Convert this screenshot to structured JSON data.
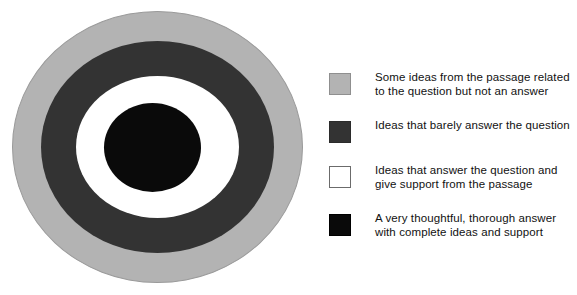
{
  "chart_data": {
    "type": "pie",
    "title": "",
    "subtitle": "",
    "xlabel": "",
    "ylabel": "",
    "grid": false,
    "legend_position": "right",
    "categories": [
      "Some ideas from the passage related to the question but not an answer",
      "Ideas that barely answer the question",
      "Ideas that answer the question and give support from the passage",
      "A very thoughtful, thorough answer with complete ideas and support"
    ],
    "values": [
      290,
      220,
      150,
      94
    ],
    "value_units": "diameter in pixels",
    "colors": [
      "#b3b3b3",
      "#333333",
      "#ffffff",
      "#0a0a0a"
    ],
    "rings": [
      {
        "index": 1,
        "position": "outermost",
        "color": "#b3b3b3",
        "color_name": "light gray",
        "diameter": 290
      },
      {
        "index": 2,
        "position": "second",
        "color": "#333333",
        "color_name": "dark gray",
        "diameter": 220
      },
      {
        "index": 3,
        "position": "third",
        "color": "#ffffff",
        "color_name": "white",
        "diameter": 150
      },
      {
        "index": 4,
        "position": "center",
        "color": "#0a0a0a",
        "color_name": "black",
        "diameter": 94
      }
    ]
  },
  "diagram": {
    "name": "concentric-rubric-target",
    "rings": [
      {
        "key": "outer",
        "color": "#b3b3b3"
      },
      {
        "key": "second",
        "color": "#333333"
      },
      {
        "key": "third",
        "color": "#ffffff"
      },
      {
        "key": "center",
        "color": "#0a0a0a"
      }
    ]
  },
  "legend": {
    "items": [
      {
        "swatch": "lightgray",
        "color": "#b3b3b3",
        "label": "Some ideas from the passage related\nto the question but not an answer"
      },
      {
        "swatch": "darkgray",
        "color": "#333333",
        "label": "Ideas that barely answer the question"
      },
      {
        "swatch": "white",
        "color": "#ffffff",
        "label": "Ideas that answer the question and\ngive support from the passage"
      },
      {
        "swatch": "black",
        "color": "#0a0a0a",
        "label": "A very thoughtful, thorough answer\nwith complete ideas and support"
      }
    ]
  }
}
